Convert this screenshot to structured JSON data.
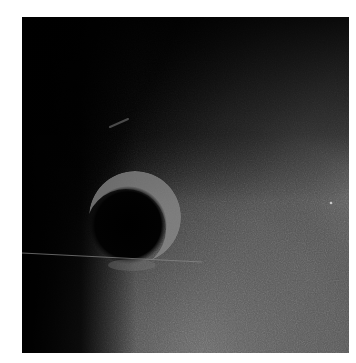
{
  "image": {
    "kind": "grayscale photograph",
    "description": "Dark upper-left field fading to noisy mid-gray lower-right, with a dark circular disc bordered by a bright crescent rim, a faint streak above it, and a thin horizontal line crossing the lower part of the disc.",
    "colors": {
      "background": "#ffffff",
      "dark_field": "#050505",
      "gray_field": "#626262",
      "rim_highlight": "#9a9a9a",
      "line": "#8a8a8a"
    },
    "features": {
      "disc": {
        "cx": 106,
        "cy": 208,
        "r": 38
      },
      "crescent": {
        "cx": 112,
        "cy": 200,
        "r": 44
      },
      "streak": {
        "x1": 88,
        "y1": 110,
        "x2": 106,
        "y2": 102
      },
      "line": {
        "x1": 0,
        "y1": 236,
        "x2": 180,
        "y2": 245
      },
      "speck": {
        "cx": 309,
        "cy": 186
      }
    }
  }
}
